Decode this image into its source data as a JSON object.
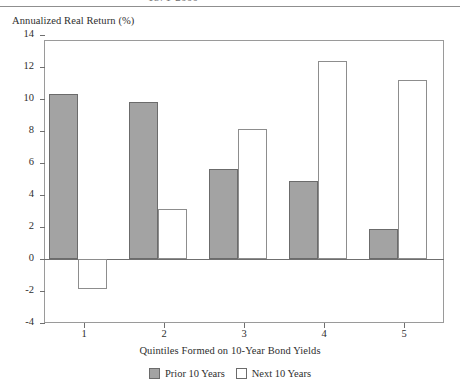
{
  "figure": {
    "cutoff_title": "1871-2000",
    "y_axis_title": "Annualized Real Return (%)"
  },
  "chart_data": {
    "type": "bar",
    "title": "",
    "xlabel": "Quintiles Formed on 10-Year Bond Yields",
    "ylabel": "Annualized Real Return (%)",
    "categories": [
      "1",
      "2",
      "3",
      "4",
      "5"
    ],
    "series": [
      {
        "name": "Prior 10 Years",
        "color": "#a3a3a3",
        "values": [
          10.3,
          9.8,
          5.6,
          4.9,
          1.9
        ]
      },
      {
        "name": "Next 10 Years",
        "color": "#ffffff",
        "values": [
          -1.9,
          3.1,
          8.1,
          12.4,
          11.2
        ]
      }
    ],
    "ylim": [
      -4,
      14
    ],
    "ytick_values": [
      14,
      12,
      10,
      8,
      6,
      4,
      2,
      0,
      -2,
      -4
    ],
    "ytick_labels": [
      "14",
      "12",
      "10",
      "8",
      "6",
      "4",
      "2",
      "0",
      "-2",
      "-4"
    ],
    "grid": false,
    "legend_position": "bottom-center"
  }
}
